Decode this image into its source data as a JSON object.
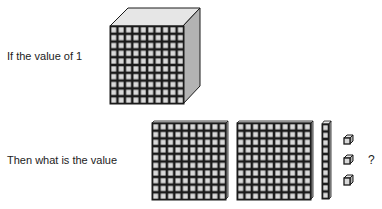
{
  "prompt": {
    "line1": "If the value of 1",
    "line2": "Then what is the value",
    "question_mark": "?"
  },
  "blocks": {
    "given": {
      "type": "cube",
      "count": 1
    },
    "asked": [
      {
        "type": "flat",
        "count": 2
      },
      {
        "type": "rod",
        "count": 1
      },
      {
        "type": "unit",
        "count": 3
      }
    ]
  },
  "colors": {
    "cell_fill": "#d9d9d9",
    "grid_line": "#1a1a1a",
    "top_face": "#e6e6e6",
    "side_face": "#b3b3b3"
  }
}
